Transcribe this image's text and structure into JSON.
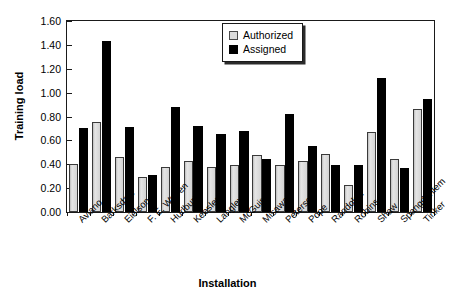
{
  "chart_data": {
    "type": "bar",
    "title": "",
    "xlabel": "Installation",
    "ylabel": "Training load",
    "ylim": [
      0.0,
      1.6
    ],
    "ytick_step": 0.2,
    "ytick_labels": [
      "0.00",
      "0.20",
      "0.40",
      "0.60",
      "0.80",
      "1.00",
      "1.20",
      "1.40",
      "1.60"
    ],
    "ytick_values": [
      0.0,
      0.2,
      0.4,
      0.6,
      0.8,
      1.0,
      1.2,
      1.4,
      1.6
    ],
    "grid": false,
    "legend_position": "upper center-right",
    "categories": [
      "Aviano",
      "Barksdale",
      "Eielson",
      "F. E. Warren",
      "Hurlburt",
      "Keesler",
      "Langley",
      "McGuire",
      "Misawa",
      "Peterson",
      "Pope",
      "Randolph",
      "Robins",
      "Shaw",
      "Spangdahlem",
      "Tinker"
    ],
    "series": [
      {
        "name": "Authorized",
        "color": "#d4d4d4",
        "values": [
          0.4,
          0.75,
          0.46,
          0.29,
          0.38,
          0.43,
          0.38,
          0.39,
          0.48,
          0.39,
          0.43,
          0.49,
          0.23,
          0.67,
          0.44,
          0.86
        ]
      },
      {
        "name": "Assigned",
        "color": "#000000",
        "values": [
          0.7,
          1.43,
          0.71,
          0.31,
          0.88,
          0.72,
          0.65,
          0.68,
          0.44,
          0.82,
          0.55,
          0.39,
          0.39,
          1.12,
          0.37,
          0.95
        ]
      }
    ]
  },
  "legend": {
    "entries": [
      {
        "label": "Authorized"
      },
      {
        "label": "Assigned"
      }
    ]
  }
}
